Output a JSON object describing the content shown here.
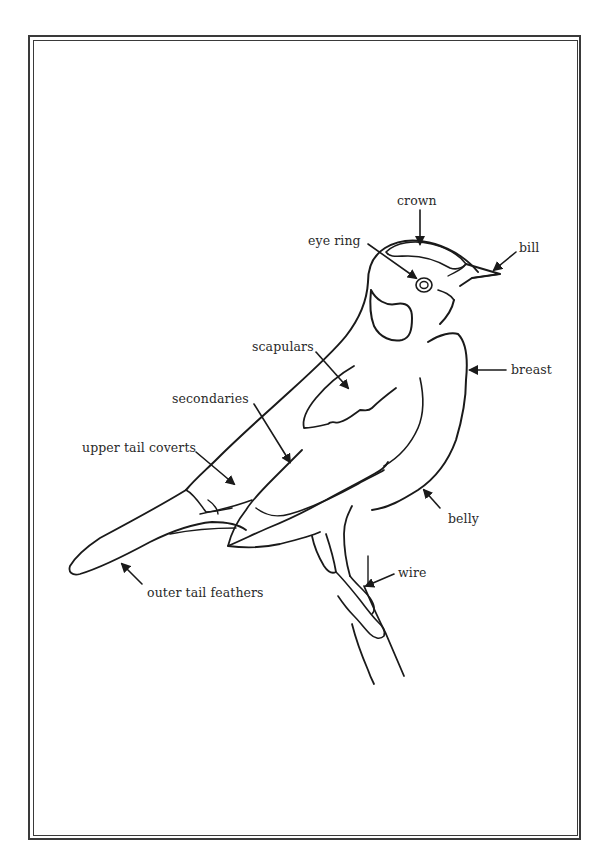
{
  "diagram": {
    "labels": [
      {
        "id": "crown",
        "text": "crown"
      },
      {
        "id": "eye_ring",
        "text": "eye ring"
      },
      {
        "id": "bill",
        "text": "bill"
      },
      {
        "id": "breast",
        "text": "breast"
      },
      {
        "id": "scapulars",
        "text": "scapulars"
      },
      {
        "id": "secondaries",
        "text": "secondaries"
      },
      {
        "id": "upper_tail_coverts",
        "text": "upper tail coverts"
      },
      {
        "id": "belly",
        "text": "belly"
      },
      {
        "id": "wire",
        "text": "wire"
      },
      {
        "id": "outer_tail_feathers",
        "text": "outer tail feathers"
      }
    ]
  }
}
